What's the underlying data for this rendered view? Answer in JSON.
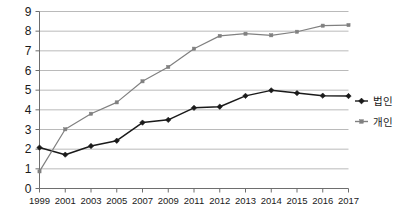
{
  "chart_data": {
    "type": "line",
    "title": "",
    "subtitle": "",
    "xlabel": "",
    "ylabel": "",
    "categories": [
      "1999",
      "2001",
      "2003",
      "2005",
      "2007",
      "2009",
      "2011",
      "2012",
      "2013",
      "2014",
      "2015",
      "2016",
      "2017"
    ],
    "x_tick_labels": [
      "1999",
      "2001",
      "2003",
      "2005",
      "2007",
      "2009",
      "2011",
      "2012",
      "2013",
      "2014",
      "2015",
      "2016",
      "2017"
    ],
    "y_tick_labels": [
      "0",
      "1",
      "2",
      "3",
      "4",
      "5",
      "6",
      "7",
      "8",
      "9"
    ],
    "ylim": [
      0,
      9
    ],
    "ytick_step": 1,
    "grid": true,
    "grid_axis": "y",
    "legend_position": "right",
    "series": [
      {
        "name": "법인",
        "color": "#1a1a1a",
        "marker": "diamond",
        "values": [
          2.08,
          1.72,
          2.16,
          2.43,
          3.35,
          3.49,
          4.1,
          4.16,
          4.71,
          4.99,
          4.85,
          4.72,
          4.7
        ]
      },
      {
        "name": "개인",
        "color": "#808080",
        "marker": "square",
        "values": [
          0.87,
          3.01,
          3.8,
          4.38,
          5.45,
          6.18,
          7.11,
          7.76,
          7.87,
          7.79,
          7.97,
          8.28,
          8.31
        ]
      }
    ]
  },
  "legend": {
    "items": [
      {
        "label": "법인",
        "color": "#1a1a1a",
        "marker": "diamond"
      },
      {
        "label": "개인",
        "color": "#808080",
        "marker": "square"
      }
    ]
  },
  "colors": {
    "series_corporate": "#1a1a1a",
    "series_individual": "#808080",
    "gridline": "#a8a8a8",
    "axis": "#6e6e6e",
    "background": "#ffffff",
    "text": "#1a1a1a"
  }
}
